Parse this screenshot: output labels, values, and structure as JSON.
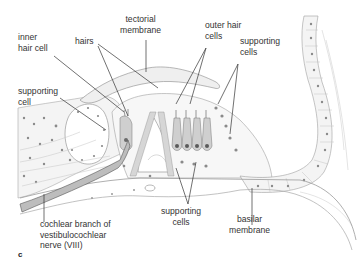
{
  "figure": {
    "panel_letter": "c"
  },
  "labels": {
    "tectorial_membrane": [
      "tectorial",
      "membrane"
    ],
    "inner_hair_cell": [
      "inner",
      "hair cell"
    ],
    "hairs": "hairs",
    "outer_hair_cells": [
      "outer hair",
      "cells"
    ],
    "supporting_cells_top": [
      "supporting",
      "cells"
    ],
    "supporting_cell_left": [
      "supporting",
      "cell"
    ],
    "cochlear_nerve": [
      "cochlear branch of",
      "vestibulocochlear",
      "nerve (VIII)"
    ],
    "supporting_cells_bottom": [
      "supporting",
      "cells"
    ],
    "basilar_membrane": [
      "basilar",
      "membrane"
    ]
  },
  "colors": {
    "line": "#333333",
    "tissue_stroke": "#9a9a9a",
    "tissue_fill": "#f3f3f3",
    "nucleus": "#8a8a8a",
    "nerve": "#555555"
  }
}
